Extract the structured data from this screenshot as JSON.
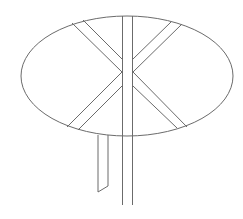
{
  "figure": {
    "stroke_color": "#6b6b6b",
    "background": "#ffffff",
    "ellipse": {
      "cx": 127,
      "cy": 76,
      "rx": 106,
      "ry": 60
    },
    "post": {
      "x_left": 122.5,
      "x_right": 132.5,
      "y_top": 16,
      "y_bottom": 205
    },
    "small_post": {
      "x_left": 98,
      "x_right": 108,
      "y_top": 135,
      "y_bottom_left": 192,
      "y_bottom_right": 186
    },
    "bands": [
      {
        "name": "upper-left",
        "lines": [
          [
            72,
            23,
            122,
            72
          ],
          [
            83,
            20,
            122,
            59
          ]
        ]
      },
      {
        "name": "lower-left",
        "lines": [
          [
            67,
            127,
            122,
            72
          ],
          [
            78,
            130,
            122,
            86
          ]
        ]
      },
      {
        "name": "upper-right",
        "lines": [
          [
            182,
            24,
            133,
            72
          ],
          [
            171,
            22,
            133,
            59
          ]
        ]
      },
      {
        "name": "lower-right",
        "lines": [
          [
            187,
            127,
            133,
            72
          ],
          [
            177,
            128,
            133,
            86
          ]
        ]
      }
    ]
  }
}
